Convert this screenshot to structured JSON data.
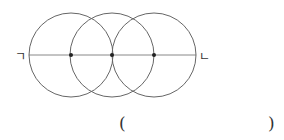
{
  "diagram": {
    "type": "geometry-construction",
    "line": {
      "x1": 29,
      "y1": 55,
      "x2": 196,
      "y2": 55,
      "color": "#888888"
    },
    "circles": [
      {
        "cx": 71,
        "cy": 55,
        "r": 42,
        "color": "#666666"
      },
      {
        "cx": 112,
        "cy": 55,
        "r": 42,
        "color": "#666666"
      },
      {
        "cx": 154,
        "cy": 55,
        "r": 42,
        "color": "#666666"
      }
    ],
    "points": [
      {
        "x": 71,
        "y": 55
      },
      {
        "x": 112,
        "y": 55
      },
      {
        "x": 154,
        "y": 55
      }
    ],
    "endpoint_labels": {
      "left": "ㄱ",
      "right": "ㄴ"
    }
  },
  "answer": {
    "open": "(",
    "close": ")",
    "value": ""
  }
}
